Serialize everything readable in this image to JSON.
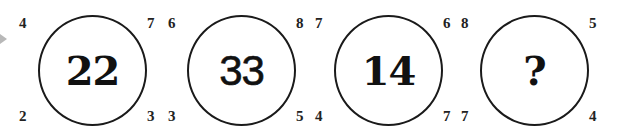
{
  "puzzle": {
    "circles": [
      {
        "center": "22",
        "top_left": "4",
        "top_right": "7",
        "bottom_left": "2",
        "bottom_right": "3"
      },
      {
        "center": "33",
        "top_left": "6",
        "top_right": "8",
        "bottom_left": "3",
        "bottom_right": "5"
      },
      {
        "center": "14",
        "top_left": "7",
        "top_right": "6",
        "bottom_left": "4",
        "bottom_right": "7"
      },
      {
        "center": "?",
        "top_left": "8",
        "top_right": "5",
        "bottom_left": "7",
        "bottom_right": "4"
      }
    ]
  },
  "colors": {
    "stroke": "#1a1a1a",
    "text": "#111111",
    "arrow": "#b8b8b8",
    "background": "#ffffff"
  },
  "icons": {
    "pointer": "triangle-right-icon"
  }
}
